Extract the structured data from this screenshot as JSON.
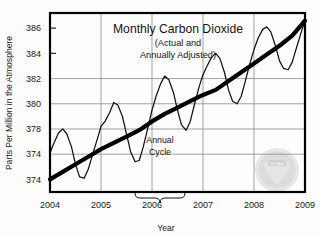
{
  "figure": {
    "name": "monthly-carbon-dioxide-chart",
    "background_color": "#fdfdfd",
    "frame_color": "#000000",
    "grid_color": "#8a8a8a",
    "curve_color": "#111111",
    "trend_color": "#000000"
  },
  "chart_data": {
    "type": "line",
    "title": "Monthly Carbon Dioxide",
    "subtitle_line1": "(Actual and",
    "subtitle_line2": "Annually Adjusted)",
    "xlabel": "Year",
    "ylabel": "Parts Per Million in the Atmosphere",
    "xlim": [
      2004,
      2009
    ],
    "ylim": [
      373.0,
      387.2
    ],
    "grid": "horizontal-and-vertical",
    "legend": "none",
    "xticks": [
      2004,
      2005,
      2006,
      2007,
      2008,
      2009
    ],
    "xtick_labels": [
      "2004",
      "2005",
      "2006",
      "2007",
      "2008",
      "2009"
    ],
    "yticks": [
      386,
      384,
      382,
      380,
      378,
      376,
      374
    ],
    "ytick_labels": [
      "386",
      "384",
      "382",
      "380",
      "378",
      "374",
      "374"
    ],
    "gridline_yvalues": [
      382,
      380,
      378,
      376
    ],
    "annotations": [
      {
        "text_line1": "Annual",
        "text_line2": "Cycle",
        "kind": "brace-label",
        "x": 2006.05,
        "y": 376.1
      }
    ],
    "series": [
      {
        "name": "Monthly actual CO2",
        "style": "thin-line",
        "color": "#111111",
        "x": [
          2004.0,
          2004.08,
          2004.17,
          2004.25,
          2004.33,
          2004.42,
          2004.5,
          2004.58,
          2004.67,
          2004.75,
          2004.83,
          2004.92,
          2005.0,
          2005.08,
          2005.17,
          2005.25,
          2005.33,
          2005.42,
          2005.5,
          2005.58,
          2005.67,
          2005.75,
          2005.83,
          2005.92,
          2006.0,
          2006.08,
          2006.17,
          2006.25,
          2006.33,
          2006.42,
          2006.5,
          2006.58,
          2006.67,
          2006.75,
          2006.83,
          2006.92,
          2007.0,
          2007.08,
          2007.17,
          2007.25,
          2007.33,
          2007.42,
          2007.5,
          2007.58,
          2007.67,
          2007.75,
          2007.83,
          2007.92,
          2008.0,
          2008.08,
          2008.17,
          2008.25,
          2008.33,
          2008.42,
          2008.5,
          2008.58,
          2008.67,
          2008.75,
          2008.83,
          2008.92,
          2009.0
        ],
        "y": [
          376.1,
          376.9,
          377.7,
          378.0,
          377.6,
          376.6,
          375.2,
          374.2,
          374.1,
          374.8,
          375.9,
          377.1,
          378.2,
          378.6,
          379.3,
          380.1,
          379.9,
          379.0,
          377.6,
          376.2,
          375.4,
          375.5,
          376.6,
          378.1,
          379.5,
          380.6,
          381.6,
          382.2,
          381.9,
          380.9,
          379.5,
          378.3,
          377.9,
          378.6,
          379.9,
          381.3,
          382.3,
          383.0,
          383.7,
          384.0,
          383.6,
          382.5,
          381.1,
          380.2,
          380.0,
          380.6,
          381.8,
          383.2,
          384.3,
          385.2,
          385.9,
          386.1,
          385.7,
          384.6,
          383.4,
          382.8,
          382.7,
          383.3,
          384.4,
          385.6,
          386.6
        ]
      },
      {
        "name": "Annually adjusted trend",
        "style": "thick-line",
        "color": "#000000",
        "x": [
          2004.0,
          2004.25,
          2004.5,
          2004.75,
          2005.0,
          2005.25,
          2005.5,
          2005.75,
          2006.0,
          2006.25,
          2006.5,
          2006.75,
          2007.0,
          2007.25,
          2007.5,
          2007.75,
          2008.0,
          2008.25,
          2008.5,
          2008.75,
          2009.0
        ],
        "y": [
          374.0,
          374.6,
          375.2,
          375.8,
          376.4,
          376.9,
          377.4,
          377.9,
          378.6,
          379.2,
          379.7,
          380.2,
          380.7,
          381.1,
          381.8,
          382.5,
          383.2,
          383.9,
          384.6,
          385.4,
          386.6
        ]
      }
    ]
  },
  "watermark": {
    "name": "noaa-seal",
    "label": "NOAA",
    "color": "#b9b9b9"
  }
}
